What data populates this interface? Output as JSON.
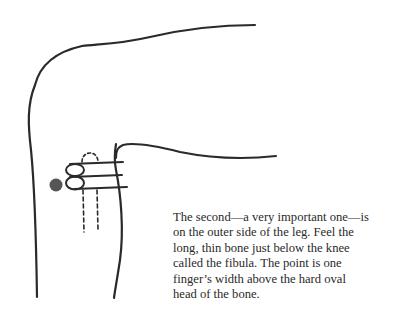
{
  "illustration": {
    "subject": "bent knee with hand placing three fingers below the knee on the outer side of the leg",
    "point_marker_color": "#555555",
    "line_color": "#2a2a2a"
  },
  "caption": {
    "lines": [
      "The second—a very important one—is",
      "on the outer side of the leg. Feel the",
      "long, thin bone just below the knee",
      "called the fibula. The point is one",
      "finger’s width above the hard oval",
      "head of the bone."
    ]
  }
}
